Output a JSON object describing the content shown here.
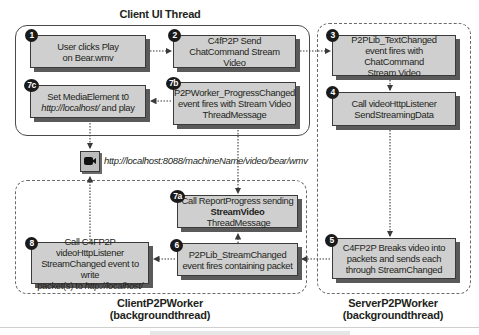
{
  "regions": {
    "client_ui_thread": {
      "title": "Client UI Thread"
    },
    "server_worker": {
      "title_line1": "ServerP2PWorker",
      "title_line2": "(backgroundthread)"
    },
    "client_worker": {
      "title_line1": "ClientP2PWorker",
      "title_line2": "(backgroundthread)"
    }
  },
  "steps": {
    "s1": {
      "badge": "1",
      "line1": "User clicks Play",
      "line2": "on Bear.wmv"
    },
    "s2": {
      "badge": "2",
      "line1": "C4fP2P Send",
      "line2": "ChatCommand Stream Video"
    },
    "s3": {
      "badge": "3",
      "line1": "P2PLib_TextChanged",
      "line2": "event fires with ChatCommand",
      "line3": "Stream Video"
    },
    "s4": {
      "badge": "4",
      "line1": "Call videoHttpListener",
      "line2": "SendStreamingData"
    },
    "s5": {
      "badge": "5",
      "line1": "C4FP2P Breaks video into",
      "line2": "packets and sends each",
      "line3": "through StreamChanged"
    },
    "s6": {
      "badge": "6",
      "line1": "P2PLib_StreamChanged",
      "line2": "event fires containing packet"
    },
    "s7a": {
      "badge": "7a",
      "line1": "Call ReportProgress sending",
      "line2_bold": "StreamVideo",
      "line2_rest": " ThreadMessage"
    },
    "s7b": {
      "badge": "7b",
      "line1": "P2PWorker_ProgressChanged",
      "line2": "event fires with Stream Video",
      "line3": "ThreadMessage"
    },
    "s7c": {
      "badge": "7c",
      "line1": "Set MediaElement t0",
      "line2_italic": "http://localhost/",
      "line2_rest": " and play"
    },
    "s8": {
      "badge": "8",
      "line1": "Call C4FP2P videoHttpListener",
      "line2": "StreamChanged event to write",
      "line3_rest": "packet(s) to ",
      "line3_italic": "http://localhost/"
    }
  },
  "media": {
    "icon": "video-camera-icon",
    "url": "http://localhost:8088/machineName/video/bear/wmv"
  },
  "colors": {
    "box_fill": "#cfcfcf",
    "box_border": "#3a3a3a",
    "badge": "#1a1a1a",
    "arrow": "#3a3a3a"
  }
}
